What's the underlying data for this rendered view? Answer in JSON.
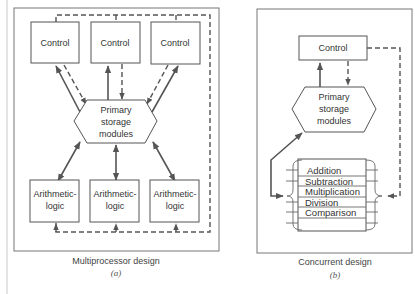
{
  "panel_a": {
    "controls": [
      "Control",
      "Control",
      "Control"
    ],
    "storage": [
      "Primary",
      "storage",
      "modules"
    ],
    "arithmetic": [
      [
        "Arithmetic-",
        "logic"
      ],
      [
        "Arithmetic-",
        "logic"
      ],
      [
        "Arithmetic-",
        "logic"
      ]
    ],
    "caption": "Multiprocessor design",
    "sublabel": "(a)"
  },
  "panel_b": {
    "control": "Control",
    "storage": [
      "Primary",
      "storage",
      "modules"
    ],
    "functions": [
      "Addition",
      "Subtraction",
      "Multiplication",
      "Division",
      "Comparison"
    ],
    "caption": "Concurrent design",
    "sublabel": "(b)"
  },
  "colors": {
    "line": "#555555",
    "frame": "#777777",
    "text": "#333333"
  }
}
